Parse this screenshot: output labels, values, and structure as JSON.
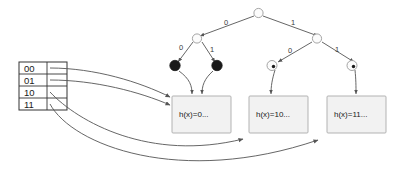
{
  "diagram": {
    "colors": {
      "stroke": "#555555",
      "box_fill": "#f2f2f2",
      "box_stroke": "#aaaaaa",
      "node_fill_empty": "#fcfcfc",
      "node_fill_full": "#1a1a1a",
      "text": "#1a1a1a"
    }
  },
  "directory": {
    "name": "directory-table",
    "entries": [
      {
        "label": "00"
      },
      {
        "label": "01"
      },
      {
        "label": "10"
      },
      {
        "label": "11"
      }
    ]
  },
  "trie": {
    "root": {
      "id": "root",
      "style": "hollow"
    },
    "edge_labels": {
      "root_left": "0",
      "root_right": "1",
      "left_left": "0",
      "left_right": "1",
      "right_left": "0",
      "right_right": "1"
    },
    "nodes": [
      {
        "id": "n-root",
        "style": "hollow"
      },
      {
        "id": "n-0",
        "style": "hollow"
      },
      {
        "id": "n-1",
        "style": "hollow"
      },
      {
        "id": "n-00",
        "style": "filled"
      },
      {
        "id": "n-01",
        "style": "filled"
      },
      {
        "id": "n-10",
        "style": "dotted"
      },
      {
        "id": "n-11",
        "style": "dotted"
      }
    ]
  },
  "buckets": [
    {
      "id": "bucket-0",
      "label": "h(x)=0..."
    },
    {
      "id": "bucket-10",
      "label": "h(x)=10..."
    },
    {
      "id": "bucket-11",
      "label": "h(x)=11..."
    }
  ]
}
